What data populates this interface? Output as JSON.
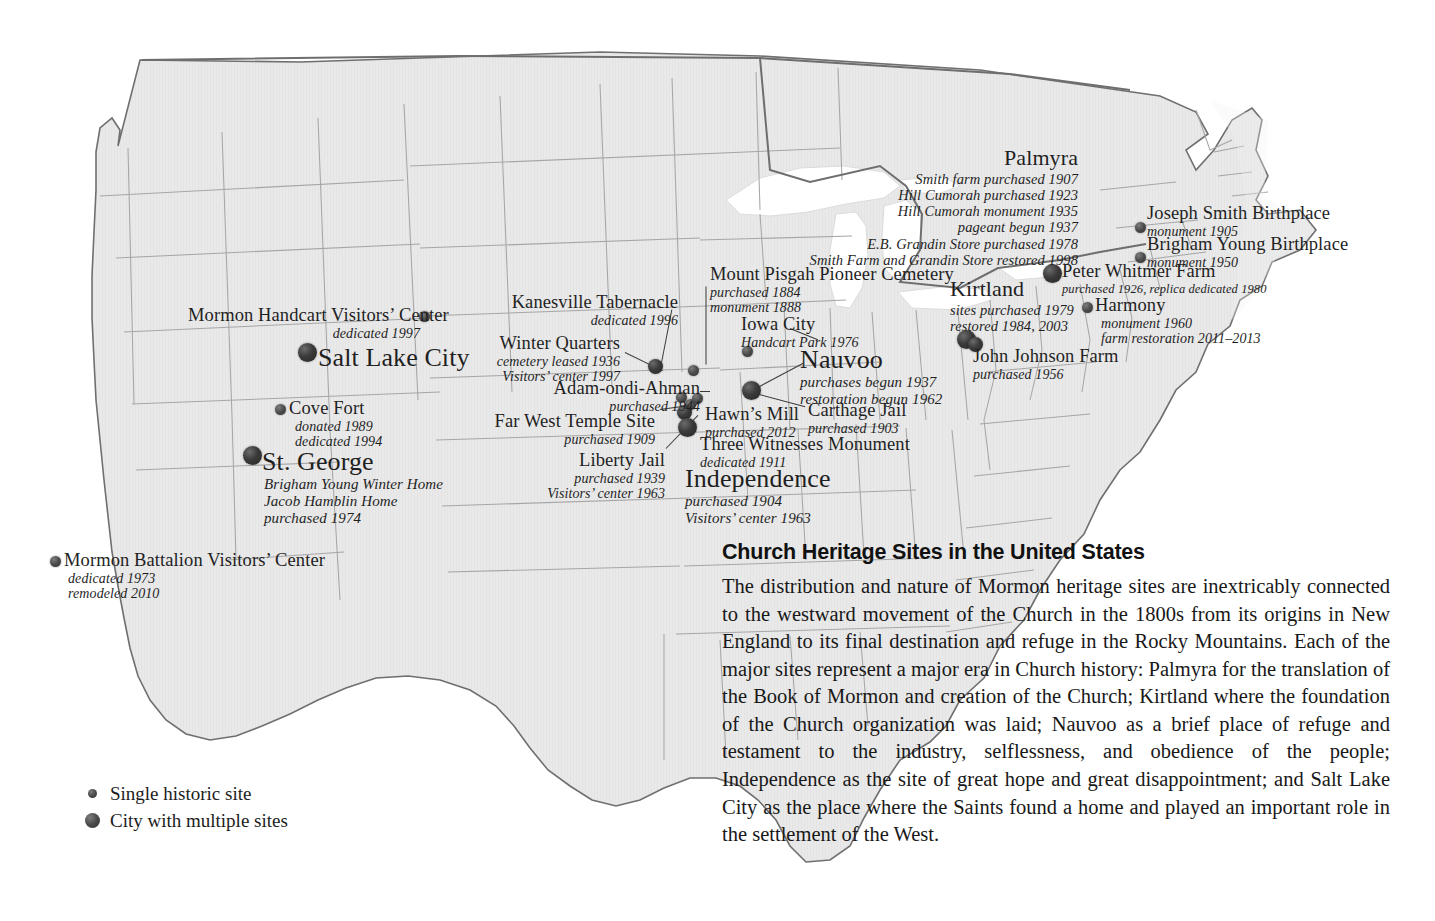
{
  "title": "Church Heritage Sites in the United States",
  "legend": {
    "items": [
      {
        "label": "Single historic site",
        "kind": "small"
      },
      {
        "label": "City with multiple sites",
        "kind": "large"
      }
    ]
  },
  "description": {
    "heading": "Church Heritage Sites in the United States",
    "body": "The distribution and nature of Mormon heritage sites are inextricably connected to the westward movement of the Church in the 1800s from its origins in New England to its final destination and refuge in the Rocky Mountains. Each of the major sites represent a major era in Church history: Palmyra for the translation of the Book of Mormon and creation of the Church; Kirtland where the foundation of the Church organization was laid; Nauvoo as a brief place of refuge and testament to the industry, selflessness, and obedience of the people; Independence as the site of great hope and great disappointment; and Salt Lake City as the place where the Saints found a home and played an important role in the settlement of the West."
  },
  "colors": {
    "land": "#e9e9e9",
    "border": "#9a9a9a",
    "outline": "#6f6f6f",
    "water": "#ffffff",
    "marker": "#333333",
    "text": "#1a1a1a"
  },
  "sites": [
    {
      "id": "palmyra",
      "name": "Palmyra",
      "lines": [
        "Smith farm purchased 1907",
        "Hill Cumorah purchased 1923",
        "Hill Cumorah monument 1935",
        "pageant begun 1937",
        "E.B. Grandin Store purchased 1978",
        "Smith Farm and Grandin Store restored 1998"
      ]
    },
    {
      "id": "joseph-smith-birthplace",
      "name": "Joseph Smith Birthplace",
      "lines": [
        "monument 1905"
      ]
    },
    {
      "id": "brigham-young-birthplace",
      "name": "Brigham Young Birthplace",
      "lines": [
        "monument 1950"
      ]
    },
    {
      "id": "peter-whitmer-farm",
      "name": "Peter Whitmer Farm",
      "lines": [
        "purchased 1926, replica dedicated 1980"
      ]
    },
    {
      "id": "harmony",
      "name": "Harmony",
      "lines": [
        "monument 1960",
        "farm restoration 2011–2013"
      ]
    },
    {
      "id": "kirtland",
      "name": "Kirtland",
      "lines": [
        "sites purchased 1979",
        "restored 1984, 2003"
      ]
    },
    {
      "id": "john-johnson-farm",
      "name": "John Johnson Farm",
      "lines": [
        "purchased 1956"
      ]
    },
    {
      "id": "mount-pisgah",
      "name": "Mount Pisgah Pioneer Cemetery",
      "lines": [
        "purchased 1884",
        "monument 1888"
      ]
    },
    {
      "id": "iowa-city",
      "name": "Iowa City",
      "lines": [
        "Handcart Park 1976"
      ]
    },
    {
      "id": "nauvoo",
      "name": "Nauvoo",
      "lines": [
        "purchases begun 1937",
        "restoration begun 1962"
      ]
    },
    {
      "id": "carthage-jail",
      "name": "Carthage Jail",
      "lines": [
        "purchased 1903"
      ]
    },
    {
      "id": "kanesville-tabernacle",
      "name": "Kanesville Tabernacle",
      "lines": [
        "dedicated 1996"
      ]
    },
    {
      "id": "winter-quarters",
      "name": "Winter Quarters",
      "lines": [
        "cemetery leased 1936",
        "Visitors’ center 1997"
      ]
    },
    {
      "id": "adam-ondi-ahman",
      "name": "Adam-ondi-Ahman",
      "lines": [
        "purchased 1944"
      ]
    },
    {
      "id": "far-west-temple-site",
      "name": "Far West Temple Site",
      "lines": [
        "purchased 1909"
      ]
    },
    {
      "id": "hawns-mill",
      "name": "Hawn’s Mill",
      "lines": [
        "purchased 2012"
      ]
    },
    {
      "id": "three-witnesses-monument",
      "name": "Three Witnesses Monument",
      "lines": [
        "dedicated 1911"
      ]
    },
    {
      "id": "liberty-jail",
      "name": "Liberty Jail",
      "lines": [
        "purchased 1939",
        "Visitors’ center 1963"
      ]
    },
    {
      "id": "independence",
      "name": "Independence",
      "lines": [
        "purchased 1904",
        "Visitors’ center 1963"
      ]
    },
    {
      "id": "mormon-handcart",
      "name": "Mormon Handcart Visitors’ Center",
      "lines": [
        "dedicated 1997"
      ]
    },
    {
      "id": "salt-lake-city",
      "name": "Salt Lake City",
      "lines": []
    },
    {
      "id": "cove-fort",
      "name": "Cove Fort",
      "lines": [
        "donated 1989",
        "dedicated 1994"
      ]
    },
    {
      "id": "st-george",
      "name": "St. George",
      "lines": [
        "Brigham Young Winter Home",
        "Jacob Hamblin Home",
        "purchased 1974"
      ]
    },
    {
      "id": "mormon-battalion",
      "name": "Mormon Battalion Visitors’ Center",
      "lines": [
        "dedicated 1973",
        "remodeled 2010"
      ]
    }
  ]
}
